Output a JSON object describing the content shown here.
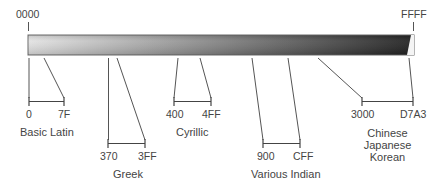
{
  "diagram": {
    "type": "unicode-range-map",
    "bar": {
      "start_label": "0000",
      "end_label": "FFFF",
      "gradient_start": "#e2e2e2",
      "gradient_end": "#1e1e1e",
      "outline": "#666666"
    },
    "ranges": [
      {
        "name": "Basic Latin",
        "start": "0",
        "end": "7F"
      },
      {
        "name": "Greek",
        "start": "370",
        "end": "3FF"
      },
      {
        "name": "Cyrillic",
        "start": "400",
        "end": "4FF"
      },
      {
        "name": "Various Indian",
        "start": "900",
        "end": "CFF"
      },
      {
        "name_lines": [
          "Chinese",
          "Japanese",
          "Korean"
        ],
        "start": "3000",
        "end": "D7A3"
      }
    ]
  }
}
